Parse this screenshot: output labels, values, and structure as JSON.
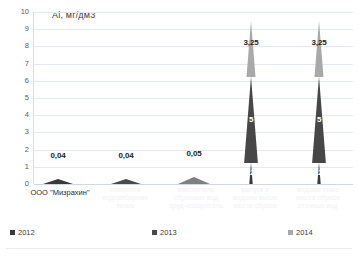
{
  "chart_data": {
    "type": "bar",
    "title": "Al, мг/дм3",
    "xlabel": "",
    "ylabel": "",
    "ylim": [
      0,
      10
    ],
    "ytick_labels": [
      "10",
      "9",
      "8",
      "7",
      "6",
      "5",
      "4",
      "3",
      "2",
      "1",
      "0"
    ],
    "grid": true,
    "legend_position": "bottom",
    "categories": [
      "ООО \"Мизрахин\"",
      "",
      "",
      "",
      ""
    ],
    "series": [
      {
        "name": "2012",
        "color": "#3a3a3a",
        "values": [
          0.04,
          null,
          null,
          1.25,
          1.25
        ]
      },
      {
        "name": "2013",
        "color": "#4a4a4a",
        "values": [
          null,
          0.04,
          null,
          5,
          5
        ]
      },
      {
        "name": "2014",
        "color": "#a6a6a6",
        "values": [
          null,
          null,
          0.05,
          3.25,
          3.25
        ]
      }
    ],
    "marks": [
      {
        "id": "m1",
        "label": "0,04",
        "value": 0.04,
        "x_center": 57,
        "series": "2012",
        "color": "#3a3a3a",
        "label_y": 152,
        "cone_w": 30,
        "cone_h": 5
      },
      {
        "id": "m2",
        "label": "0,04",
        "value": 0.04,
        "x_center": 125,
        "series": "2013",
        "color": "#4a4a4a",
        "label_y": 152,
        "cone_w": 30,
        "cone_h": 5
      },
      {
        "id": "m3",
        "label": "0,05",
        "value": 0.05,
        "x_center": 193,
        "series": "2014",
        "color": "#808080",
        "label_y": 150,
        "cone_w": 32,
        "cone_h": 7
      }
    ],
    "stacks": [
      {
        "id": "s1",
        "x_center": 250,
        "total": 9.5,
        "segments": [
          {
            "series": "2012",
            "label": "1,25",
            "value": 1.25,
            "color": "#3a3a3a",
            "label_inside": true
          },
          {
            "series": "2013",
            "label": "5",
            "value": 5,
            "color": "#474747",
            "label_inside": true
          },
          {
            "series": "2014",
            "label": "3,25",
            "value": 3.25,
            "color": "#a9a9a9",
            "label_inside": false
          }
        ]
      },
      {
        "id": "s2",
        "x_center": 318,
        "total": 9.5,
        "segments": [
          {
            "series": "2012",
            "label": "1,25",
            "value": 1.25,
            "color": "#3a3a3a",
            "label_inside": true
          },
          {
            "series": "2013",
            "label": "5",
            "value": 5,
            "color": "#474747",
            "label_inside": true
          },
          {
            "series": "2014",
            "label": "3,25",
            "value": 3.25,
            "color": "#a9a9a9",
            "label_inside": false
          }
        ]
      }
    ],
    "x_axis_labels": [
      {
        "id": "x1",
        "text": "ООО \"Мизрахин\"",
        "x_center": 60,
        "y": 188,
        "faint": false
      },
      {
        "id": "x2",
        "text": "скважина",
        "x_center": 125,
        "y": 186,
        "faint": true
      },
      {
        "id": "x3",
        "text": "водозаборная",
        "x_center": 125,
        "y": 194,
        "faint": true
      },
      {
        "id": "x4",
        "text": "точка",
        "x_center": 125,
        "y": 202,
        "faint": true
      },
      {
        "id": "x5",
        "text": "накопитель",
        "x_center": 196,
        "y": 186,
        "faint": true
      },
      {
        "id": "x6",
        "text": "сбросных вод",
        "x_center": 196,
        "y": 194,
        "faint": true
      },
      {
        "id": "x7",
        "text": "пруд-испаритель",
        "x_center": 196,
        "y": 202,
        "faint": true
      },
      {
        "id": "x8",
        "text": "выпуск в",
        "x_center": 255,
        "y": 186,
        "faint": true
      },
      {
        "id": "x9",
        "text": "водоем выше",
        "x_center": 255,
        "y": 194,
        "faint": true
      },
      {
        "id": "x10",
        "text": "места сброса",
        "x_center": 255,
        "y": 202,
        "faint": true
      },
      {
        "id": "x11",
        "text": "водоем ниже",
        "x_center": 318,
        "y": 186,
        "faint": true
      },
      {
        "id": "x12",
        "text": "места сброса",
        "x_center": 318,
        "y": 194,
        "faint": true
      },
      {
        "id": "x13",
        "text": "сточных вод",
        "x_center": 318,
        "y": 202,
        "faint": true
      }
    ],
    "legend": [
      {
        "label": "2012",
        "color": "#3a3a3a",
        "x": 10
      },
      {
        "label": "2013",
        "color": "#4a4a4a",
        "x": 152
      },
      {
        "label": "2014",
        "color": "#a9a9a9",
        "x": 288
      }
    ]
  }
}
